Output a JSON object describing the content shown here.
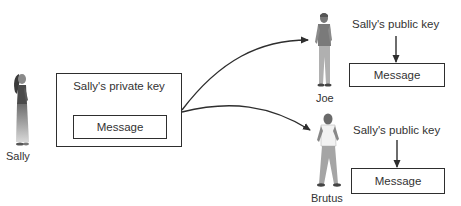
{
  "diagram": {
    "title": "",
    "sender": {
      "name": "Sally",
      "key_label": "Sally's private key",
      "message_label": "Message"
    },
    "recipients": [
      {
        "name": "Joe",
        "key_label": "Sally's public key",
        "message_label": "Message"
      },
      {
        "name": "Brutus",
        "key_label": "Sally's public key",
        "message_label": "Message"
      }
    ],
    "edges": [
      {
        "from": "Sally's private key box",
        "to": "Joe"
      },
      {
        "from": "Sally's private key box",
        "to": "Brutus"
      }
    ],
    "colors": {
      "line": "#2e2e2e",
      "text": "#333333",
      "background": "#ffffff"
    }
  }
}
